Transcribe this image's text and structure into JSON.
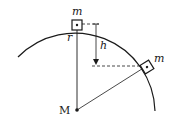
{
  "diagram": {
    "labels": {
      "top_mass": "m",
      "side_mass": "m",
      "radius": "r",
      "height": "h",
      "center_mass": "M"
    },
    "colors": {
      "stroke": "#1a1a1a",
      "background": "#ffffff"
    }
  }
}
